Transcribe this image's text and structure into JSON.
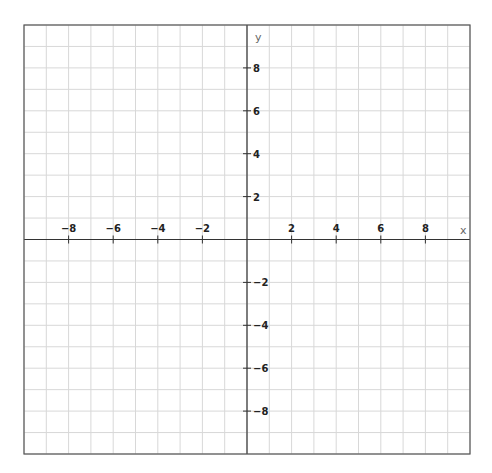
{
  "chart_data": {
    "type": "line",
    "title": "",
    "xlabel": "x",
    "ylabel": "y",
    "xlim": [
      -10,
      10
    ],
    "ylim": [
      -10,
      10
    ],
    "grid": true,
    "grid_step": 1,
    "x_ticks": [
      -8,
      -6,
      -4,
      -2,
      2,
      4,
      6,
      8
    ],
    "y_ticks": [
      8,
      6,
      4,
      2,
      -2,
      -4,
      -6,
      -8
    ],
    "series": []
  },
  "layout": {
    "box": {
      "left": 24,
      "top": 25,
      "right": 470,
      "bottom": 454
    },
    "colors": {
      "grid": "#d8d8d8",
      "axis": "#333333",
      "border": "#555555",
      "label": "#222222",
      "axis_label": "#666666"
    }
  }
}
